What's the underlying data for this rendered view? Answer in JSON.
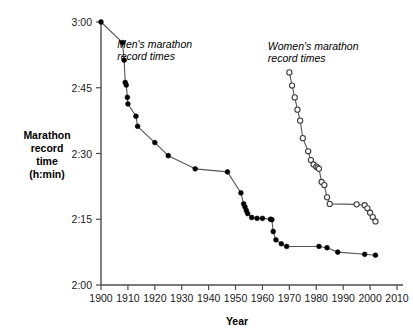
{
  "chart_data": {
    "type": "line",
    "title": "",
    "xlabel": "Year",
    "ylabel": "Marathon record time (h:min)",
    "ylabel_lines": [
      "Marathon",
      "record",
      "time",
      "(h:min)"
    ],
    "xlim": [
      1900,
      2010
    ],
    "ylim": [
      120,
      180
    ],
    "y_unit": "minutes",
    "grid": false,
    "legend_position": "inline-annotations",
    "xticks": [
      1900,
      1910,
      1920,
      1930,
      1940,
      1950,
      1960,
      1970,
      1980,
      1990,
      2000,
      2010
    ],
    "xtick_labels": [
      "1900",
      "1910",
      "1920",
      "1930",
      "1940",
      "1950",
      "1960",
      "1970",
      "1980",
      "1990",
      "2000",
      "2010"
    ],
    "yticks": [
      120,
      135,
      150,
      165,
      180
    ],
    "ytick_labels": [
      "2:00",
      "2:15",
      "2:30",
      "2:45",
      "3:00"
    ],
    "series": [
      {
        "name": "Men's marathon record times",
        "marker": "filled-circle",
        "annotation_lines": [
          "Men's marathon",
          "record times"
        ],
        "points": [
          {
            "x": 1900,
            "y": 180.0,
            "label": "3:00"
          },
          {
            "x": 1908,
            "y": 175.3,
            "label": "2:55"
          },
          {
            "x": 1908.6,
            "y": 171.3,
            "label": "2:51"
          },
          {
            "x": 1909,
            "y": 166.2,
            "label": "2:46"
          },
          {
            "x": 1909.4,
            "y": 165.6,
            "label": "2:46"
          },
          {
            "x": 1909.8,
            "y": 162.8,
            "label": "2:43"
          },
          {
            "x": 1910,
            "y": 161.3,
            "label": "2:41"
          },
          {
            "x": 1913,
            "y": 158.5,
            "label": "2:38"
          },
          {
            "x": 1913.6,
            "y": 156.2,
            "label": "2:36"
          },
          {
            "x": 1920,
            "y": 152.5,
            "label": "2:32"
          },
          {
            "x": 1925,
            "y": 149.5,
            "label": "2:29"
          },
          {
            "x": 1935,
            "y": 146.5,
            "label": "2:26"
          },
          {
            "x": 1947,
            "y": 145.8,
            "label": "2:26"
          },
          {
            "x": 1952,
            "y": 141.0,
            "label": "2:21"
          },
          {
            "x": 1953,
            "y": 138.5,
            "label": "2:18"
          },
          {
            "x": 1953.5,
            "y": 137.8,
            "label": "2:18"
          },
          {
            "x": 1954,
            "y": 137.0,
            "label": "2:17"
          },
          {
            "x": 1954.5,
            "y": 136.3,
            "label": "2:16"
          },
          {
            "x": 1956,
            "y": 135.4,
            "label": "2:15"
          },
          {
            "x": 1958,
            "y": 135.2,
            "label": "2:15"
          },
          {
            "x": 1960,
            "y": 135.2,
            "label": "2:15"
          },
          {
            "x": 1963,
            "y": 135.0,
            "label": "2:15"
          },
          {
            "x": 1963.5,
            "y": 134.9,
            "label": "2:15"
          },
          {
            "x": 1964,
            "y": 132.2,
            "label": "2:12"
          },
          {
            "x": 1965,
            "y": 130.3,
            "label": "2:10"
          },
          {
            "x": 1967,
            "y": 129.4,
            "label": "2:09"
          },
          {
            "x": 1969,
            "y": 128.8,
            "label": "2:09"
          },
          {
            "x": 1981,
            "y": 128.8,
            "label": "2:09"
          },
          {
            "x": 1984,
            "y": 128.5,
            "label": "2:08"
          },
          {
            "x": 1988,
            "y": 127.5,
            "label": "2:07"
          },
          {
            "x": 1998,
            "y": 127.0,
            "label": "2:07"
          },
          {
            "x": 2002,
            "y": 126.8,
            "label": "2:07"
          }
        ]
      },
      {
        "name": "Women's marathon record times",
        "marker": "open-circle",
        "annotation_lines": [
          "Women's marathon",
          "record times"
        ],
        "points": [
          {
            "x": 1970,
            "y": 168.5,
            "label": "2:48"
          },
          {
            "x": 1971,
            "y": 165.5,
            "label": "2:45"
          },
          {
            "x": 1972,
            "y": 162.8,
            "label": "2:43"
          },
          {
            "x": 1973,
            "y": 160.0,
            "label": "2:40"
          },
          {
            "x": 1974,
            "y": 157.5,
            "label": "2:37"
          },
          {
            "x": 1975,
            "y": 153.5,
            "label": "2:33"
          },
          {
            "x": 1977,
            "y": 150.5,
            "label": "2:30"
          },
          {
            "x": 1978,
            "y": 148.5,
            "label": "2:28"
          },
          {
            "x": 1979,
            "y": 147.5,
            "label": "2:27"
          },
          {
            "x": 1980,
            "y": 147.0,
            "label": "2:27"
          },
          {
            "x": 1980.5,
            "y": 146.8,
            "label": "2:27"
          },
          {
            "x": 1981,
            "y": 146.5,
            "label": "2:26"
          },
          {
            "x": 1982,
            "y": 143.5,
            "label": "2:23"
          },
          {
            "x": 1983,
            "y": 142.8,
            "label": "2:23"
          },
          {
            "x": 1984,
            "y": 140.0,
            "label": "2:20"
          },
          {
            "x": 1985,
            "y": 138.5,
            "label": "2:18"
          },
          {
            "x": 1995,
            "y": 138.4,
            "label": "2:18"
          },
          {
            "x": 1998,
            "y": 138.2,
            "label": "2:18"
          },
          {
            "x": 1999,
            "y": 137.5,
            "label": "2:18"
          },
          {
            "x": 2000,
            "y": 136.5,
            "label": "2:17"
          },
          {
            "x": 2001,
            "y": 135.5,
            "label": "2:16"
          },
          {
            "x": 2002,
            "y": 134.5,
            "label": "2:15"
          }
        ]
      }
    ],
    "annotations": [
      {
        "text_lines": [
          "Men's marathon",
          "record times"
        ],
        "x": 1906,
        "y": 174.0
      },
      {
        "text_lines": [
          "Women's marathon",
          "record times"
        ],
        "x": 1962,
        "y": 173.5
      }
    ]
  }
}
